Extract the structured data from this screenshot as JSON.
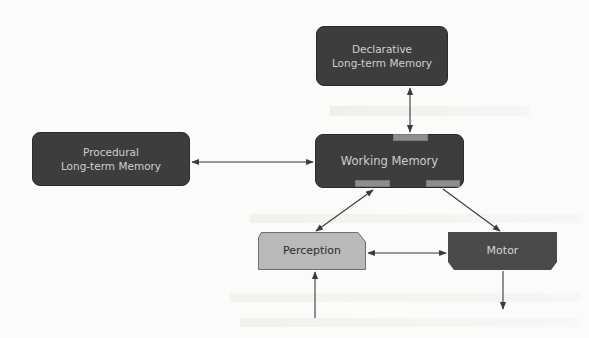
{
  "diagram": {
    "title": "",
    "nodes": {
      "declarative": {
        "label": "Declarative\nLong-term Memory",
        "fill": "#3d3d3d"
      },
      "procedural": {
        "label": "Procedural\nLong-term Memory",
        "fill": "#3d3d3d"
      },
      "working": {
        "label": "Working Memory",
        "fill": "#3d3d3d",
        "slots": 3,
        "slot_fill": "#8e8e8e"
      },
      "perception": {
        "label": "Perception",
        "fill": "#b9b9b9"
      },
      "motor": {
        "label": "Motor",
        "fill": "#4a4a4a"
      }
    },
    "edges": [
      {
        "from": "Declarative Long-term Memory",
        "to": "Working Memory",
        "direction": "bidirectional"
      },
      {
        "from": "Procedural Long-term Memory",
        "to": "Working Memory",
        "direction": "bidirectional"
      },
      {
        "from": "Working Memory",
        "to": "Perception",
        "direction": "bidirectional"
      },
      {
        "from": "Working Memory",
        "to": "Motor",
        "direction": "forward"
      },
      {
        "from": "Perception",
        "to": "Motor",
        "direction": "bidirectional"
      },
      {
        "from": "external input",
        "to": "Perception",
        "direction": "forward"
      },
      {
        "from": "Motor",
        "to": "external output",
        "direction": "forward"
      }
    ],
    "arrow_color": "#3a3a3a",
    "background": "#fbfbfa"
  }
}
